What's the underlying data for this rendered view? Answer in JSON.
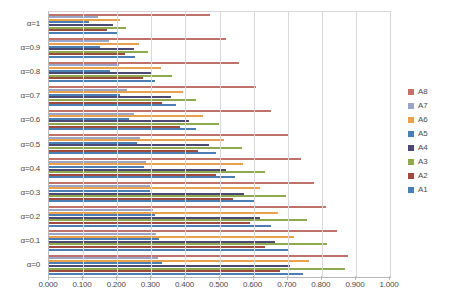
{
  "chart_data": {
    "type": "bar",
    "orientation": "horizontal",
    "title": "",
    "xlabel": "",
    "ylabel": "",
    "xlim": [
      0.0,
      1.0
    ],
    "grid": true,
    "legend_position": "right",
    "categories": [
      "α=1",
      "α=0.9",
      "α=0.8",
      "α=0.7",
      "α=0.6",
      "α=0.5",
      "α=0.4",
      "α=0.3",
      "α=0.2",
      "α=0.1",
      "α=0"
    ],
    "xticks": [
      0.0,
      0.1,
      0.2,
      0.3,
      0.4,
      0.5,
      0.6,
      0.7,
      0.8,
      0.9,
      1.0
    ],
    "xticklabels": [
      "0.000",
      "0.100",
      "0.200",
      "0.300",
      "0.400",
      "0.500",
      "0.600",
      "0.700",
      "0.800",
      "0.900",
      "1.000"
    ],
    "series": [
      {
        "name": "A8",
        "color": "#c0726a",
        "values": [
          0.472,
          0.52,
          0.558,
          0.606,
          0.65,
          0.7,
          0.74,
          0.778,
          0.812,
          0.845,
          0.878
        ]
      },
      {
        "name": "A7",
        "color": "#9aa6c8",
        "values": [
          0.145,
          0.175,
          0.205,
          0.228,
          0.25,
          0.268,
          0.284,
          0.296,
          0.306,
          0.314,
          0.32
        ]
      },
      {
        "name": "A6",
        "color": "#e8a14c",
        "values": [
          0.207,
          0.265,
          0.328,
          0.392,
          0.452,
          0.512,
          0.568,
          0.62,
          0.672,
          0.718,
          0.762
        ]
      },
      {
        "name": "A5",
        "color": "#4a7fb5",
        "values": [
          0.118,
          0.15,
          0.18,
          0.208,
          0.234,
          0.258,
          0.278,
          0.296,
          0.31,
          0.322,
          0.332
        ]
      },
      {
        "name": "A4",
        "color": "#4c4a72",
        "values": [
          0.188,
          0.248,
          0.3,
          0.358,
          0.412,
          0.468,
          0.52,
          0.572,
          0.62,
          0.664,
          0.706
        ]
      },
      {
        "name": "A3",
        "color": "#8ea94e",
        "values": [
          0.226,
          0.29,
          0.36,
          0.43,
          0.498,
          0.566,
          0.632,
          0.696,
          0.756,
          0.814,
          0.868
        ]
      },
      {
        "name": "A2",
        "color": "#9e4a3c",
        "values": [
          0.17,
          0.222,
          0.276,
          0.33,
          0.384,
          0.438,
          0.49,
          0.54,
          0.588,
          0.632,
          0.676
        ]
      },
      {
        "name": "A1",
        "color": "#4a7fb5",
        "values": [
          0.2,
          0.252,
          0.312,
          0.372,
          0.43,
          0.49,
          0.546,
          0.6,
          0.652,
          0.7,
          0.746
        ]
      }
    ]
  },
  "legend": {
    "items": [
      {
        "label": "A8",
        "color": "#c0726a"
      },
      {
        "label": "A7",
        "color": "#9aa6c8"
      },
      {
        "label": "A6",
        "color": "#e8a14c"
      },
      {
        "label": "A5",
        "color": "#4a7fb5"
      },
      {
        "label": "A4",
        "color": "#4c4a72"
      },
      {
        "label": "A3",
        "color": "#8ea94e"
      },
      {
        "label": "A2",
        "color": "#9e4a3c"
      },
      {
        "label": "A1",
        "color": "#4a7fb5"
      }
    ]
  }
}
